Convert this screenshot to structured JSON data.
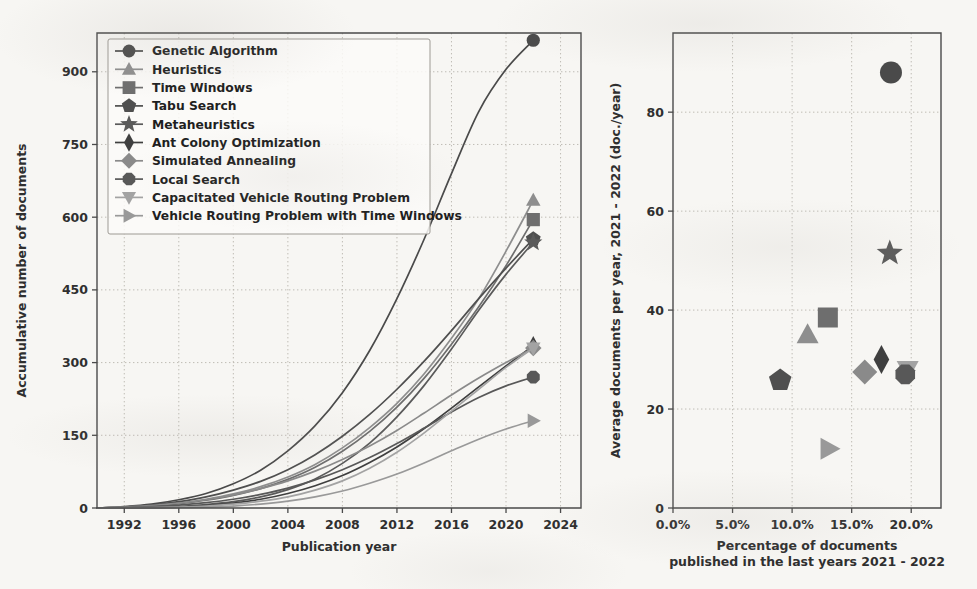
{
  "figure": {
    "background_color": "#f7f6f3",
    "panels": [
      "left-line-chart",
      "right-scatter-chart"
    ]
  },
  "chart_data": [
    {
      "id": "accumulative-documents",
      "type": "line",
      "title": "",
      "xlabel": "Publication year",
      "ylabel": "Accumulative number of documents",
      "xlim": [
        1990,
        2025.5
      ],
      "ylim": [
        0,
        980
      ],
      "xticks": [
        1992,
        1996,
        2000,
        2004,
        2008,
        2012,
        2016,
        2020,
        2024
      ],
      "xticklabels": [
        "1992",
        "1996",
        "2000",
        "2004",
        "2008",
        "2012",
        "2016",
        "2020",
        "2024"
      ],
      "yticks": [
        0,
        150,
        300,
        450,
        600,
        750,
        900
      ],
      "yticklabels": [
        "0",
        "150",
        "300",
        "450",
        "600",
        "750",
        "900"
      ],
      "grid": true,
      "legend_position": "upper left",
      "x": [
        1990,
        1992,
        1994,
        1996,
        1998,
        2000,
        2002,
        2004,
        2006,
        2008,
        2010,
        2012,
        2014,
        2016,
        2018,
        2020,
        2022
      ],
      "series": [
        {
          "name": "Genetic Algorithm",
          "marker": "circle",
          "color": "#4a4a4a",
          "values": [
            0,
            3,
            8,
            17,
            30,
            50,
            78,
            118,
            170,
            238,
            325,
            432,
            555,
            690,
            818,
            905,
            965
          ]
        },
        {
          "name": "Heuristics",
          "marker": "triangle-up",
          "color": "#8e8e8e",
          "values": [
            0,
            2,
            5,
            10,
            18,
            29,
            44,
            64,
            90,
            124,
            166,
            216,
            277,
            350,
            432,
            530,
            635
          ]
        },
        {
          "name": "Time Windows",
          "marker": "square",
          "color": "#6e6e6e",
          "values": [
            0,
            1,
            4,
            9,
            16,
            26,
            40,
            59,
            84,
            117,
            158,
            208,
            268,
            338,
            415,
            500,
            595
          ]
        },
        {
          "name": "Tabu Search",
          "marker": "pentagon",
          "color": "#4f4f4f",
          "values": [
            0,
            2,
            6,
            13,
            23,
            37,
            55,
            79,
            110,
            148,
            193,
            245,
            303,
            366,
            432,
            495,
            555
          ]
        },
        {
          "name": "Metaheuristics",
          "marker": "star",
          "color": "#5a5a5a",
          "values": [
            0,
            0,
            1,
            3,
            7,
            13,
            23,
            38,
            60,
            92,
            134,
            188,
            253,
            328,
            408,
            482,
            548
          ]
        },
        {
          "name": "Ant Colony Optimization",
          "marker": "thin-diamond",
          "color": "#3f3f3f",
          "values": [
            0,
            0,
            1,
            2,
            5,
            10,
            18,
            30,
            46,
            67,
            94,
            126,
            164,
            206,
            250,
            293,
            335
          ]
        },
        {
          "name": "Simulated Annealing",
          "marker": "diamond",
          "color": "#8a8a8a",
          "values": [
            0,
            2,
            5,
            10,
            17,
            27,
            40,
            56,
            76,
            100,
            128,
            160,
            196,
            233,
            268,
            300,
            330
          ]
        },
        {
          "name": "Local Search",
          "marker": "octagon",
          "color": "#585858",
          "values": [
            0,
            1,
            3,
            6,
            11,
            18,
            28,
            41,
            58,
            79,
            104,
            133,
            165,
            198,
            228,
            252,
            270
          ]
        },
        {
          "name": "Capacitated Vehicle Routing Problem",
          "marker": "triangle-down",
          "color": "#a3a3a3",
          "values": [
            0,
            0,
            1,
            2,
            4,
            8,
            14,
            23,
            37,
            56,
            82,
            115,
            155,
            200,
            245,
            290,
            330
          ]
        },
        {
          "name": "Vehicle Routing Problem with Time Windows",
          "marker": "triangle-right",
          "color": "#999999",
          "values": [
            0,
            0,
            0,
            1,
            2,
            4,
            8,
            14,
            23,
            35,
            51,
            70,
            93,
            118,
            142,
            163,
            180
          ]
        }
      ]
    },
    {
      "id": "average-docs-vs-percentage",
      "type": "scatter",
      "title": "",
      "xlabel": "Percentage of documents\npublished in the last years 2021 - 2022",
      "xlabel_line1": "Percentage of documents",
      "xlabel_line2": "published in the last years 2021 - 2022",
      "ylabel": "Average documents per year, 2021 - 2022 (doc./year)",
      "xlim": [
        0,
        22.5
      ],
      "ylim": [
        0,
        96
      ],
      "xticks": [
        0,
        5,
        10,
        15,
        20
      ],
      "xticklabels": [
        "0.0%",
        "5.0%",
        "10.0%",
        "15.0%",
        "20.0%"
      ],
      "yticks": [
        0,
        20,
        40,
        60,
        80
      ],
      "yticklabels": [
        "0",
        "20",
        "40",
        "60",
        "80"
      ],
      "grid": true,
      "points": [
        {
          "name": "Genetic Algorithm",
          "marker": "circle",
          "color": "#4a4a4a",
          "x": 18.3,
          "y": 88.0
        },
        {
          "name": "Metaheuristics",
          "marker": "star",
          "color": "#5a5a5a",
          "x": 18.2,
          "y": 51.5
        },
        {
          "name": "Time Windows",
          "marker": "square",
          "color": "#6e6e6e",
          "x": 13.0,
          "y": 38.5
        },
        {
          "name": "Heuristics",
          "marker": "triangle-up",
          "color": "#8e8e8e",
          "x": 11.3,
          "y": 35.0
        },
        {
          "name": "Ant Colony Optimization",
          "marker": "thin-diamond",
          "color": "#3f3f3f",
          "x": 17.5,
          "y": 30.0
        },
        {
          "name": "Simulated Annealing",
          "marker": "diamond",
          "color": "#8a8a8a",
          "x": 16.1,
          "y": 27.5
        },
        {
          "name": "Capacitated Vehicle Routing Problem",
          "marker": "triangle-down",
          "color": "#a3a3a3",
          "x": 19.7,
          "y": 28.0
        },
        {
          "name": "Local Search",
          "marker": "octagon",
          "color": "#585858",
          "x": 19.5,
          "y": 27.0
        },
        {
          "name": "Tabu Search",
          "marker": "pentagon",
          "color": "#4f4f4f",
          "x": 9.0,
          "y": 25.8
        },
        {
          "name": "Vehicle Routing Problem with Time Windows",
          "marker": "triangle-right",
          "color": "#999999",
          "x": 13.1,
          "y": 12.0
        }
      ]
    }
  ],
  "legend": {
    "items": [
      {
        "label": "Genetic Algorithm",
        "marker": "circle",
        "color": "#4a4a4a"
      },
      {
        "label": "Heuristics",
        "marker": "triangle-up",
        "color": "#8e8e8e"
      },
      {
        "label": "Time Windows",
        "marker": "square",
        "color": "#6e6e6e"
      },
      {
        "label": "Tabu Search",
        "marker": "pentagon",
        "color": "#4f4f4f"
      },
      {
        "label": "Metaheuristics",
        "marker": "star",
        "color": "#5a5a5a"
      },
      {
        "label": "Ant Colony Optimization",
        "marker": "thin-diamond",
        "color": "#3f3f3f"
      },
      {
        "label": "Simulated Annealing",
        "marker": "diamond",
        "color": "#8a8a8a"
      },
      {
        "label": "Local Search",
        "marker": "octagon",
        "color": "#585858"
      },
      {
        "label": "Capacitated Vehicle Routing Problem",
        "marker": "triangle-down",
        "color": "#a3a3a3"
      },
      {
        "label": "Vehicle Routing Problem with Time Windows",
        "marker": "triangle-right",
        "color": "#999999"
      }
    ]
  }
}
